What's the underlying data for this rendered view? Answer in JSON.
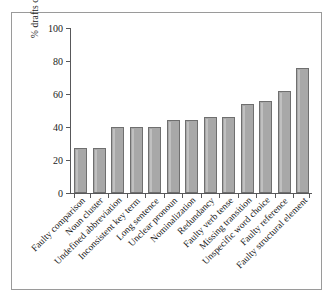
{
  "chart_data": {
    "type": "bar",
    "title": "",
    "xlabel": "",
    "ylabel": "% drafts containing this error",
    "ylim": [
      0,
      100
    ],
    "yticks": [
      0,
      20,
      40,
      60,
      80,
      100
    ],
    "grid": false,
    "legend": null,
    "categories": [
      "Faulty comparison",
      "Noun cluster",
      "Undefined abbreviation",
      "Inconsistent key term",
      "Long sentence",
      "Unclear pronoun",
      "Nominalization",
      "Redundancy",
      "Faulty verb tense",
      "Missing transition",
      "Unspecific word choice",
      "Faulty reference",
      "Faulty structural element"
    ],
    "values": [
      27,
      27,
      40,
      40,
      40,
      44,
      44,
      46,
      46,
      54,
      56,
      62,
      76
    ],
    "bar_color": "#a8a8a8",
    "bar_border_color": "#6f6f6f",
    "axis_color": "#58585a",
    "frame_color": "#9a9a9a",
    "background": "#ffffff"
  }
}
